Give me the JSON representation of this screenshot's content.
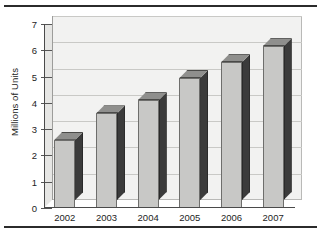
{
  "chart_data": {
    "type": "bar",
    "title": "",
    "subtitle": "",
    "xlabel": "",
    "ylabel": "Millions of Units",
    "categories": [
      "2002",
      "2003",
      "2004",
      "2005",
      "2006",
      "2007"
    ],
    "values": [
      2.6,
      3.6,
      4.1,
      4.95,
      5.55,
      6.15
    ],
    "series": [
      {
        "name": "Units",
        "values": [
          2.6,
          3.6,
          4.1,
          4.95,
          5.55,
          6.15
        ]
      }
    ],
    "ylim": [
      0,
      7
    ],
    "ytick_labels": [
      "0",
      "1",
      "2",
      "3",
      "4",
      "5",
      "6",
      "7"
    ],
    "ytick_values": [
      0,
      1,
      2,
      3,
      4,
      5,
      6,
      7
    ],
    "ytick_step": 1,
    "grid": true,
    "grid_axis": "y",
    "legend": false,
    "legend_position": "none",
    "style": "3d-column",
    "annotations": [],
    "colors": {
      "bar_front": "#c8c8c6",
      "bar_top": "#8f8f8d",
      "bar_side": "#3b3b3b",
      "plot_background": "#f2f2f1",
      "gridline": "#c9c9c6",
      "axis": "#4a4a4a",
      "text": "#1d1d1d",
      "rule": "#2b2b2b",
      "page_background": "#ffffff"
    }
  }
}
